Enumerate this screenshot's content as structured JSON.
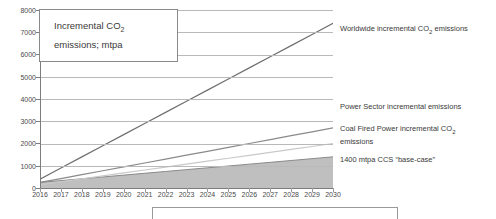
{
  "annotation": {
    "line1": "Incremental CO₂",
    "line2": "emissions; mtpa"
  },
  "labels": {
    "worldwide": "Worldwide incremental CO₂ emissions",
    "power_sector": "Power Sector incremental emissions",
    "coal_fired_1": "Coal Fired Power incremental CO₂",
    "coal_fired_2": "emissions",
    "ccs": "1400 mtpa CCS “base-case”"
  },
  "colors": {
    "worldwide_line": "#6f6f6f",
    "power_sector_line": "#8a8a8a",
    "coal_fired_line": "#c9c9c9",
    "ccs_fill": "#bfbfbf",
    "ccs_stroke": "#8a8a8a",
    "grid": "#b9b9b9",
    "axis": "#7d7d7d",
    "text": "#3a3a3a"
  },
  "chart_data": {
    "type": "line",
    "title": "Incremental CO2 emissions; mtpa",
    "xlabel": "",
    "ylabel": "",
    "ylim": [
      0,
      8000
    ],
    "ytick_step": 1000,
    "grid": true,
    "legend_position": "right-inline-annotations",
    "categories": [
      "2016",
      "2017",
      "2018",
      "2019",
      "2020",
      "2021",
      "2022",
      "2023",
      "2024",
      "2025",
      "2026",
      "2027",
      "2028",
      "2029",
      "2030"
    ],
    "yticks": [
      0,
      1000,
      2000,
      3000,
      4000,
      5000,
      6000,
      7000,
      8000
    ],
    "series": [
      {
        "name": "Worldwide incremental CO2 emissions",
        "type": "line",
        "values": [
          400,
          900,
          1400,
          1900,
          2400,
          2900,
          3400,
          3900,
          4400,
          4900,
          5400,
          5900,
          6400,
          6900,
          7400
        ]
      },
      {
        "name": "Power Sector incremental emissions",
        "type": "line",
        "values": [
          250,
          425,
          600,
          775,
          950,
          1125,
          1300,
          1475,
          1650,
          1825,
          2000,
          2175,
          2350,
          2525,
          2700
        ]
      },
      {
        "name": "Coal Fired Power incremental CO2 emissions",
        "type": "line",
        "values": [
          150,
          282,
          414,
          546,
          678,
          810,
          942,
          1074,
          1206,
          1338,
          1470,
          1602,
          1734,
          1866,
          2000
        ]
      },
      {
        "name": "1400 mtpa CCS \"base-case\"",
        "type": "area",
        "values": [
          250,
          332,
          414,
          496,
          579,
          661,
          743,
          825,
          907,
          989,
          1071,
          1153,
          1236,
          1318,
          1400
        ]
      }
    ]
  }
}
